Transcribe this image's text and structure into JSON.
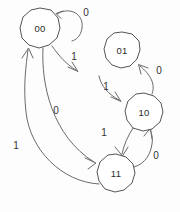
{
  "diagram": {
    "kind": "state-transition-diagram",
    "title": "",
    "background_color": "#fdfdfd",
    "stroke_color": "#6a6a6a",
    "text_color": "#2b2b2b",
    "states": [
      {
        "id": "s00",
        "label": "00",
        "cx": 40,
        "cy": 28,
        "r": 20
      },
      {
        "id": "s01",
        "label": "01",
        "cx": 122,
        "cy": 50,
        "r": 18
      },
      {
        "id": "s10",
        "label": "10",
        "cx": 144,
        "cy": 112,
        "r": 19
      },
      {
        "id": "s11",
        "label": "11",
        "cx": 116,
        "cy": 173,
        "r": 19
      }
    ],
    "transitions": [
      {
        "id": "t1",
        "from": "00",
        "to": "00",
        "label": "0",
        "lx": 86,
        "ly": 13
      },
      {
        "id": "t2",
        "from": "00",
        "to": "01",
        "label": "1",
        "lx": 74,
        "ly": 57
      },
      {
        "id": "t3",
        "from": "10",
        "to": "01",
        "label": "0",
        "lx": 159,
        "ly": 71
      },
      {
        "id": "t4",
        "from": "01",
        "to": "10",
        "label": "1",
        "lx": 106,
        "ly": 87
      },
      {
        "id": "t5",
        "from": "00",
        "to": "11",
        "label": "0",
        "lx": 56,
        "ly": 111
      },
      {
        "id": "t6",
        "from": "10",
        "to": "11",
        "label": "1",
        "lx": 104,
        "ly": 133
      },
      {
        "id": "t7",
        "from": "11",
        "to": "10",
        "label": "0",
        "lx": 156,
        "ly": 156
      },
      {
        "id": "t8",
        "from": "11",
        "to": "00",
        "label": "1",
        "lx": 16,
        "ly": 146
      }
    ]
  }
}
